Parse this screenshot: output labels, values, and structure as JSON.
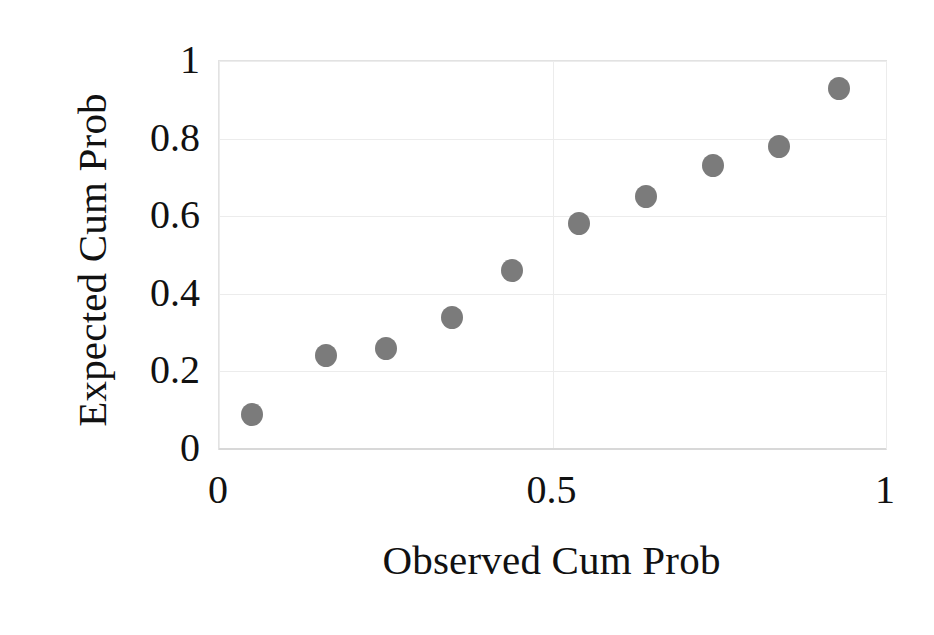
{
  "chart_data": {
    "type": "scatter",
    "title": "",
    "xlabel": "Observed Cum Prob",
    "ylabel": "Expected Cum Prob",
    "xlim": [
      0,
      1
    ],
    "ylim": [
      0,
      1
    ],
    "x_ticks": [
      "0",
      "0.5",
      "1"
    ],
    "x_tick_values": [
      0,
      0.5,
      1
    ],
    "y_ticks": [
      "0",
      "0.2",
      "0.4",
      "0.6",
      "0.8",
      "1"
    ],
    "y_tick_values": [
      0,
      0.2,
      0.4,
      0.6,
      0.8,
      1
    ],
    "grid": true,
    "legend": "none",
    "marker_color": "#7b7b7b",
    "gridline_color": "#ececec",
    "series": [
      {
        "name": "Normal P-P points",
        "points": [
          {
            "x": 0.05,
            "y": 0.09
          },
          {
            "x": 0.16,
            "y": 0.24
          },
          {
            "x": 0.25,
            "y": 0.26
          },
          {
            "x": 0.35,
            "y": 0.34
          },
          {
            "x": 0.44,
            "y": 0.46
          },
          {
            "x": 0.54,
            "y": 0.58
          },
          {
            "x": 0.64,
            "y": 0.65
          },
          {
            "x": 0.74,
            "y": 0.73
          },
          {
            "x": 0.84,
            "y": 0.78
          },
          {
            "x": 0.93,
            "y": 0.93
          }
        ]
      }
    ]
  },
  "axes": {
    "x_title": "Observed Cum Prob",
    "y_title": "Expected Cum Prob"
  }
}
